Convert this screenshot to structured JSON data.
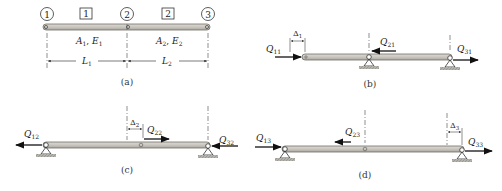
{
  "panels": {
    "a": {
      "caption": "(a)",
      "nodes": [
        "1",
        "2",
        "3"
      ],
      "elements": [
        "1",
        "2"
      ],
      "element1_props": {
        "A": "A",
        "A_sub": "1",
        "sep": ", ",
        "E": "E",
        "E_sub": "1"
      },
      "element2_props": {
        "A": "A",
        "A_sub": "2",
        "sep": ", ",
        "E": "E",
        "E_sub": "2"
      },
      "dim1": {
        "L": "L",
        "sub": "1"
      },
      "dim2": {
        "L": "L",
        "sub": "2"
      }
    },
    "b": {
      "caption": "(b)",
      "delta": {
        "sym": "Δ",
        "sub": "1"
      },
      "forces": [
        {
          "sym": "Q",
          "sub": "11",
          "direction": "right"
        },
        {
          "sym": "Q",
          "sub": "21",
          "direction": "left"
        },
        {
          "sym": "Q",
          "sub": "31",
          "direction": "right"
        }
      ]
    },
    "c": {
      "caption": "(c)",
      "delta": {
        "sym": "Δ",
        "sub": "2"
      },
      "forces": [
        {
          "sym": "Q",
          "sub": "12",
          "direction": "left"
        },
        {
          "sym": "Q",
          "sub": "22",
          "direction": "right"
        },
        {
          "sym": "Q",
          "sub": "32",
          "direction": "left"
        }
      ]
    },
    "d": {
      "caption": "(d)",
      "delta": {
        "sym": "Δ",
        "sub": "3"
      },
      "forces": [
        {
          "sym": "Q",
          "sub": "13",
          "direction": "right"
        },
        {
          "sym": "Q",
          "sub": "23",
          "direction": "left"
        },
        {
          "sym": "Q",
          "sub": "33",
          "direction": "right"
        }
      ]
    }
  },
  "colors": {
    "beam_fill": "#c8c6bf",
    "beam_edge": "#6e6c66",
    "ink": "#222222",
    "ground": "#9a9892"
  }
}
